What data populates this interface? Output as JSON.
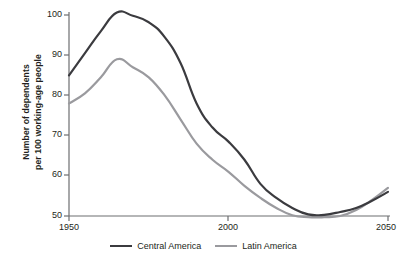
{
  "chart_data": {
    "type": "line",
    "title": "",
    "xlabel": "",
    "ylabel": "Number of dependents per 100 working-age people",
    "ylabel_line1": "Number of dependents",
    "ylabel_line2": "per 100 working-age people",
    "xlim": [
      1950,
      2050
    ],
    "ylim": [
      50,
      100
    ],
    "xticks": [
      1950,
      2000,
      2050
    ],
    "xtick_labels": [
      "1950",
      "2000",
      "2050"
    ],
    "yticks": [
      50,
      60,
      70,
      80,
      90,
      100
    ],
    "ytick_labels": [
      "50",
      "60",
      "70",
      "80",
      "90",
      "100"
    ],
    "grid": false,
    "legend_position": "bottom-center",
    "x": [
      1950,
      1955,
      1960,
      1965,
      1970,
      1975,
      1980,
      1985,
      1990,
      1995,
      2000,
      2005,
      2010,
      2015,
      2020,
      2025,
      2030,
      2035,
      2040,
      2045,
      2050
    ],
    "series": [
      {
        "name": "Central America",
        "color": "#3b3b3f",
        "values": [
          85.0,
          90.5,
          96.0,
          100.6,
          99.8,
          98.2,
          94.5,
          88.0,
          78.0,
          72.0,
          68.5,
          64.0,
          58.0,
          54.5,
          52.0,
          50.4,
          50.3,
          51.0,
          52.0,
          53.8,
          56.0
        ]
      },
      {
        "name": "Latin America",
        "color": "#9a9a9e",
        "values": [
          78.0,
          80.5,
          84.5,
          89.0,
          87.0,
          84.5,
          80.0,
          74.0,
          68.0,
          64.0,
          61.0,
          57.5,
          54.5,
          52.0,
          50.2,
          49.7,
          49.7,
          50.0,
          51.5,
          54.0,
          57.0
        ]
      }
    ]
  },
  "legend": {
    "items": [
      {
        "label": "Central America",
        "color": "#3b3b3f"
      },
      {
        "label": "Latin America",
        "color": "#9a9a9e"
      }
    ]
  },
  "axis": {
    "line_color": "#6d6e71"
  }
}
